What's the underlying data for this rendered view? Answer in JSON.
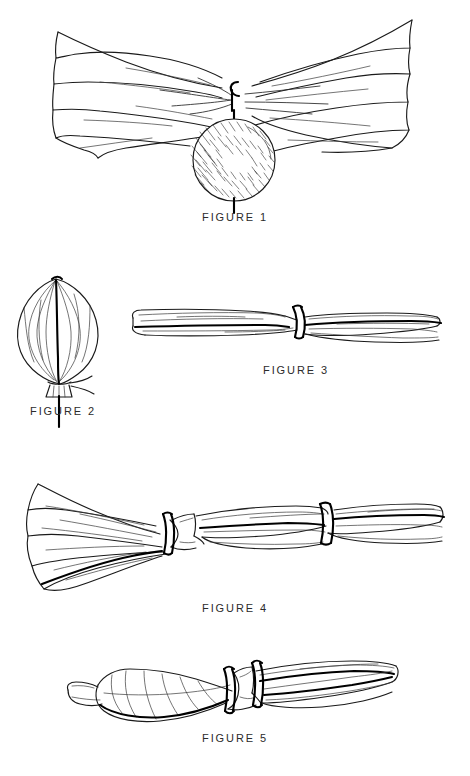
{
  "sheet": {
    "background_color": "#ffffff",
    "ink_color": "#111111",
    "caption_color": "#2b2b2b",
    "width": 470,
    "height": 776,
    "kind": "patent-drawing-sheet"
  },
  "figures": [
    {
      "id": "figure-1",
      "caption": "FIGURE 1",
      "caption_x": 235,
      "caption_y": 217,
      "subject": "flared fabric sheet gathered at center with hatched spherical ball tied below"
    },
    {
      "id": "figure-2",
      "caption": "FIGURE 2",
      "caption_x": 63,
      "caption_y": 411,
      "subject": "onion shaped gathered bundle tied at bottom with knot tails and stem"
    },
    {
      "id": "figure-3",
      "caption": "FIGURE 3",
      "caption_x": 296,
      "caption_y": 370,
      "subject": "horizontal rolled bundle bound by a single dark band near center"
    },
    {
      "id": "figure-4",
      "caption": "FIGURE 4",
      "caption_x": 235,
      "caption_y": 608,
      "subject": "fan flared bundle bound by two dark bands along the shaft"
    },
    {
      "id": "figure-5",
      "caption": "FIGURE 5",
      "caption_x": 235,
      "caption_y": 738,
      "subject": "bulbous bundle with folded flap held by two dark bands"
    }
  ]
}
